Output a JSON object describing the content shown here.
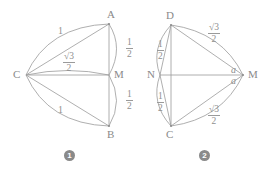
{
  "figures": [
    {
      "caption": "1",
      "vertices": [
        {
          "name": "C",
          "label": "C"
        },
        {
          "name": "A",
          "label": "A"
        },
        {
          "name": "M",
          "label": "M"
        },
        {
          "name": "B",
          "label": "B"
        }
      ],
      "arc_labels": [
        {
          "name": "arc-CA",
          "text": "1",
          "kind": "plain"
        },
        {
          "name": "arc-CM",
          "numerator": "√3",
          "denominator": "2",
          "kind": "fraction"
        },
        {
          "name": "arc-CB",
          "text": "1",
          "kind": "plain"
        },
        {
          "name": "arc-AM",
          "numerator": "1",
          "denominator": "2",
          "kind": "fraction"
        },
        {
          "name": "arc-MB",
          "numerator": "1",
          "denominator": "2",
          "kind": "fraction"
        }
      ]
    },
    {
      "caption": "2",
      "vertices": [
        {
          "name": "D",
          "label": "D"
        },
        {
          "name": "N",
          "label": "N"
        },
        {
          "name": "M",
          "label": "M"
        },
        {
          "name": "C",
          "label": "C"
        }
      ],
      "arc_labels": [
        {
          "name": "arc-DM",
          "numerator": "√3",
          "denominator": "2",
          "kind": "fraction"
        },
        {
          "name": "arc-CM",
          "numerator": "√3",
          "denominator": "2",
          "kind": "fraction"
        },
        {
          "name": "arc-DN",
          "numerator": "1",
          "denominator": "2",
          "kind": "fraction"
        },
        {
          "name": "arc-NC",
          "numerator": "1",
          "denominator": "2",
          "kind": "fraction"
        },
        {
          "name": "angle-a-upper",
          "text": "a",
          "kind": "italic"
        },
        {
          "name": "angle-a-lower",
          "text": "a",
          "kind": "italic"
        }
      ]
    }
  ],
  "colors": {
    "stroke": "#9a9a9a",
    "text": "#8c8c8c",
    "badge": "#8a8a8a",
    "background": "#ffffff"
  }
}
